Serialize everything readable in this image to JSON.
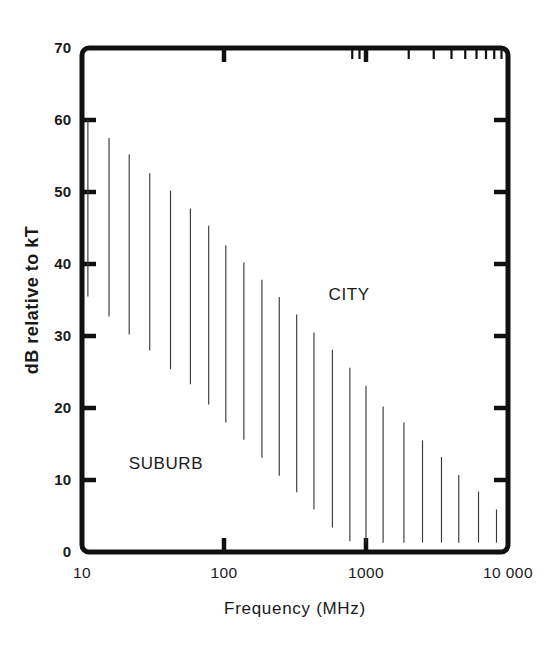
{
  "chart_data": {
    "type": "bar",
    "title": "",
    "subtitle": "",
    "xlabel": "Frequency (MHz)",
    "ylabel": "dB relative to kT",
    "xscale": "log",
    "yscale": "linear",
    "xlim": [
      10,
      10000
    ],
    "ylim": [
      0,
      70
    ],
    "grid": false,
    "legend": null,
    "x_tick_labels": [
      "10",
      "100",
      "1000",
      "10 000"
    ],
    "x_tick_values": [
      10,
      100,
      1000,
      10000
    ],
    "y_tick_labels": [
      "0",
      "10",
      "20",
      "30",
      "40",
      "50",
      "60",
      "70"
    ],
    "y_tick_values": [
      0,
      10,
      20,
      30,
      40,
      50,
      60,
      70
    ],
    "series": [
      {
        "name": "Man-made noise range (city to suburb)",
        "note": "Each vertical line spans the spread of measured noise at one frequency; the top of the line is the city level and the bottom is the suburban level.",
        "points": [
          {
            "freq": 11.0,
            "high": 60.0,
            "low": 35.5
          },
          {
            "freq": 15.5,
            "high": 57.5,
            "low": 32.7
          },
          {
            "freq": 21.5,
            "high": 55.2,
            "low": 30.2
          },
          {
            "freq": 30.0,
            "high": 52.6,
            "low": 28.0
          },
          {
            "freq": 42.0,
            "high": 50.2,
            "low": 25.4
          },
          {
            "freq": 58.0,
            "high": 47.7,
            "low": 23.3
          },
          {
            "freq": 78.0,
            "high": 45.3,
            "low": 20.5
          },
          {
            "freq": 103.0,
            "high": 42.6,
            "low": 18.0
          },
          {
            "freq": 138.0,
            "high": 40.2,
            "low": 15.6
          },
          {
            "freq": 185.0,
            "high": 37.8,
            "low": 13.1
          },
          {
            "freq": 245.0,
            "high": 35.4,
            "low": 10.6
          },
          {
            "freq": 325.0,
            "high": 33.0,
            "low": 8.3
          },
          {
            "freq": 430.0,
            "high": 30.5,
            "low": 5.9
          },
          {
            "freq": 580.0,
            "high": 28.1,
            "low": 3.4
          },
          {
            "freq": 770.0,
            "high": 25.6,
            "low": 1.5
          },
          {
            "freq": 1000.0,
            "high": 23.1,
            "low": 1.3
          },
          {
            "freq": 1320.0,
            "high": 20.2,
            "low": 1.3
          },
          {
            "freq": 1850.0,
            "high": 18.0,
            "low": 1.3
          },
          {
            "freq": 2500.0,
            "high": 15.5,
            "low": 1.3
          },
          {
            "freq": 3400.0,
            "high": 13.2,
            "low": 1.3
          },
          {
            "freq": 4500.0,
            "high": 10.7,
            "low": 1.3
          },
          {
            "freq": 6200.0,
            "high": 8.4,
            "low": 1.3
          },
          {
            "freq": 8300.0,
            "high": 5.9,
            "low": 1.3
          }
        ]
      }
    ],
    "annotations": [
      {
        "text": "CITY",
        "freq": 760,
        "db": 35.0,
        "name": "city-region-label"
      },
      {
        "text": "SUBURB",
        "freq": 39,
        "db": 11.5,
        "name": "suburb-region-label"
      }
    ],
    "colors": {
      "background": "#ffffff",
      "axis": "#111111",
      "bar": "#3a3a3a",
      "text": "#1a1a1a"
    }
  }
}
